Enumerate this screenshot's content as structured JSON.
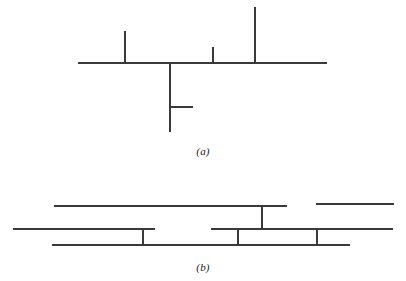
{
  "figure": {
    "background_color": "#ffffff",
    "stroke_color": "#3a3a3a",
    "stroke_width": 1.2,
    "width": 406,
    "height": 281,
    "captions": {
      "panel_a": "(a)",
      "panel_b": "(b)"
    }
  },
  "chart_data": {
    "type": "diagram",
    "title": "",
    "subtitle": "",
    "xlabel": "",
    "ylabel": "",
    "grid": false,
    "legend": "none",
    "xlim": [
      0,
      406
    ],
    "ylim": [
      0,
      281
    ],
    "panels": [
      {
        "id": "a",
        "label": "(a)",
        "label_x": 203,
        "label_y": 152,
        "description": "Horizontal trunk with three upward stubs, one long downward branch carrying a short right stub",
        "segments": [
          {
            "name": "trunk-main-horizontal",
            "orientation": "horizontal",
            "x1": 78,
            "y1": 63,
            "x2": 327,
            "y2": 63
          },
          {
            "name": "branch-up-left",
            "orientation": "vertical",
            "x1": 125,
            "y1": 31,
            "x2": 125,
            "y2": 63
          },
          {
            "name": "branch-up-middle-short",
            "orientation": "vertical",
            "x1": 213,
            "y1": 47,
            "x2": 213,
            "y2": 63
          },
          {
            "name": "branch-up-right-tall",
            "orientation": "vertical",
            "x1": 255,
            "y1": 7,
            "x2": 255,
            "y2": 63
          },
          {
            "name": "branch-down-long",
            "orientation": "vertical",
            "x1": 170,
            "y1": 63,
            "x2": 170,
            "y2": 132
          },
          {
            "name": "branch-down-right-stub",
            "orientation": "horizontal",
            "x1": 170,
            "y1": 107,
            "x2": 193,
            "y2": 107
          }
        ]
      },
      {
        "id": "b",
        "label": "(b)",
        "label_x": 203,
        "label_y": 268,
        "description": "Three stacked horizontal registers connected by short vertical risers",
        "segments": [
          {
            "name": "row-top-left-long",
            "orientation": "horizontal",
            "x1": 54,
            "y1": 206,
            "x2": 287,
            "y2": 206
          },
          {
            "name": "row-top-right-short",
            "orientation": "horizontal",
            "x1": 316,
            "y1": 204,
            "x2": 394,
            "y2": 204
          },
          {
            "name": "row-middle-left",
            "orientation": "horizontal",
            "x1": 13,
            "y1": 229,
            "x2": 155,
            "y2": 229
          },
          {
            "name": "row-middle-right",
            "orientation": "horizontal",
            "x1": 211,
            "y1": 229,
            "x2": 393,
            "y2": 229
          },
          {
            "name": "row-bottom-long",
            "orientation": "horizontal",
            "x1": 52,
            "y1": 245,
            "x2": 350,
            "y2": 245
          },
          {
            "name": "riser-left",
            "orientation": "vertical",
            "x1": 143,
            "y1": 229,
            "x2": 143,
            "y2": 245
          },
          {
            "name": "riser-center-up",
            "orientation": "vertical",
            "x1": 262,
            "y1": 206,
            "x2": 262,
            "y2": 229
          },
          {
            "name": "riser-center-down",
            "orientation": "vertical",
            "x1": 238,
            "y1": 229,
            "x2": 238,
            "y2": 245
          },
          {
            "name": "riser-right",
            "orientation": "vertical",
            "x1": 317,
            "y1": 229,
            "x2": 317,
            "y2": 245
          }
        ]
      }
    ]
  }
}
